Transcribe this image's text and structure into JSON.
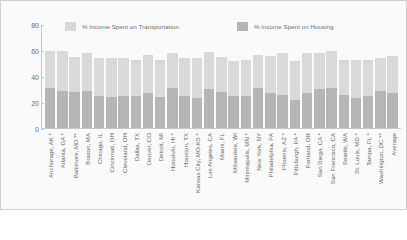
{
  "chart_data": {
    "type": "bar",
    "subtype": "stacked-bar",
    "title": "",
    "xlabel": "",
    "ylabel": "",
    "ylim": [
      0,
      80
    ],
    "yticks": [
      0,
      20,
      40,
      60,
      80
    ],
    "grid": false,
    "legend_position": "top-center",
    "colors": {
      "transportation": "#d9d9d9",
      "housing": "#b6b6b6",
      "axis": "#c8c8c8",
      "text": "#6e6e6e",
      "background": "#fafafa"
    },
    "categories": [
      "Anchorage, AK *",
      "Atlanta, GA *",
      "Baltimore, MD **",
      "Boston, MA",
      "Chicago, IL",
      "Cincinnati, OH",
      "Cleveland, OH",
      "Dallas, TX",
      "Denver, CO",
      "Detroit, MI",
      "Honolulu, HI *",
      "Houston, TX",
      "Kansas City, MO-KS *",
      "Los Angeles, CA",
      "Miami, FL",
      "Milwaukee, WI",
      "Minneapolis, MN *",
      "New York, NY",
      "Philadelphia, PA",
      "Phoenix, AZ *",
      "Pittsburgh, PA *",
      "Portland, OR",
      "San Diego, CA *",
      "San Francisco, CA",
      "Seattle, WA",
      "St. Louis, MD *",
      "Tampa, FL *",
      "Washington, DC **",
      "Average"
    ],
    "series": [
      {
        "name": "% Income Spent on Housing",
        "color": "#b6b6b6",
        "values": [
          31,
          29,
          28,
          29,
          25,
          24,
          25,
          25,
          27,
          24,
          31,
          25,
          23,
          30,
          28,
          25,
          25,
          31,
          27,
          26,
          22,
          27,
          30,
          31,
          26,
          23,
          25,
          29,
          27
        ]
      },
      {
        "name": "% Income Spent on Transportation",
        "color": "#d9d9d9",
        "values": [
          29,
          31,
          27,
          29,
          29,
          30,
          29,
          28,
          30,
          29,
          27,
          29,
          31,
          29,
          27,
          27,
          28,
          26,
          29,
          32,
          30,
          31,
          28,
          29,
          27,
          30,
          28,
          25,
          29
        ]
      }
    ],
    "totals": [
      60,
      60,
      55,
      58,
      54,
      54,
      54,
      53,
      57,
      53,
      58,
      54,
      54,
      59,
      55,
      52,
      53,
      57,
      56,
      58,
      52,
      58,
      58,
      60,
      53,
      53,
      53,
      54,
      56
    ]
  },
  "legend": {
    "entries": [
      {
        "label": "% Income Spent on Transportation",
        "color": "#d9d9d9"
      },
      {
        "label": "% Income Spent on Housing",
        "color": "#b6b6b6"
      }
    ]
  }
}
